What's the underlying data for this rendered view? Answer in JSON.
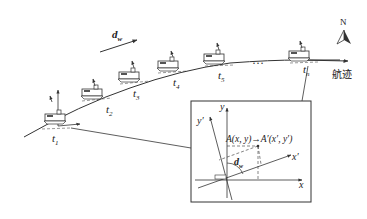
{
  "diagram": {
    "title_direction": {
      "north_label": "N",
      "icon": "north-arrow-icon"
    },
    "wave_direction": {
      "label": "d",
      "subscript": "w"
    },
    "track_label": "航迹",
    "ellipsis": "…",
    "time_labels": [
      {
        "t": "t",
        "sub": "1"
      },
      {
        "t": "t",
        "sub": "2"
      },
      {
        "t": "t",
        "sub": "3"
      },
      {
        "t": "t",
        "sub": "4"
      },
      {
        "t": "t",
        "sub": "5"
      },
      {
        "t": "t",
        "sub": "n"
      }
    ],
    "inset": {
      "axis_x": "x",
      "axis_y": "y",
      "axis_x_prime": "x′",
      "axis_y_prime": "y′",
      "transform_text": "A(x, y)→A′(x′, y′)",
      "angle_label": "d",
      "angle_sub": "w"
    },
    "colors": {
      "line": "#333333",
      "background": "#ffffff"
    }
  }
}
